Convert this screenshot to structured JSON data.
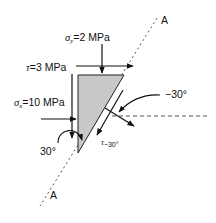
{
  "diagram": {
    "type": "stress-element-wedge",
    "axis_label_top": "A",
    "axis_label_bottom": "A",
    "sigma_y": {
      "symbol": "σ",
      "subscript": "y",
      "value": "=2 MPa"
    },
    "tau": {
      "symbol": "τ",
      "value": "=3 MPa"
    },
    "sigma_x": {
      "symbol": "σ",
      "subscript": "x",
      "value": "=10 MPa"
    },
    "angle_left": "30°",
    "angle_right": "−30°",
    "tau_result": {
      "symbol": "τ",
      "subscript": "−30°"
    },
    "colors": {
      "wedge_fill": "#c8c8c8",
      "line": "#111111",
      "dashed": "#555555"
    }
  }
}
